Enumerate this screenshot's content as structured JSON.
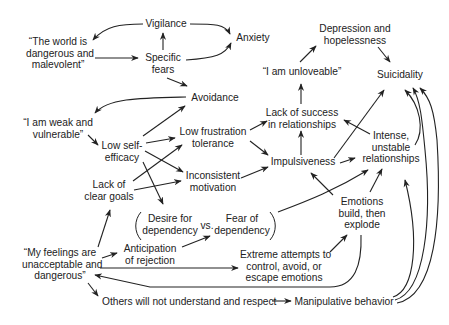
{
  "diagram": {
    "type": "causal-flow-diagram",
    "nodes": {
      "world": {
        "lines": [
          "“The world is",
          "dangerous and",
          "malevolent”"
        ]
      },
      "vigilance": {
        "lines": [
          "Vigilance"
        ]
      },
      "specific_fears": {
        "lines": [
          "Specific",
          "fears"
        ]
      },
      "anxiety": {
        "lines": [
          "Anxiety"
        ]
      },
      "depression": {
        "lines": [
          "Depression and",
          "hopelessness"
        ]
      },
      "unloveable": {
        "lines": [
          "“I am unloveable”"
        ]
      },
      "suicidality": {
        "lines": [
          "Suicidality"
        ]
      },
      "avoidance": {
        "lines": [
          "Avoidance"
        ]
      },
      "weak": {
        "lines": [
          "“I am weak and",
          "vulnerable”"
        ]
      },
      "low_self_efficacy": {
        "lines": [
          "Low self-",
          "efficacy"
        ]
      },
      "low_frustration": {
        "lines": [
          "Low frustration",
          "tolerance"
        ]
      },
      "lack_success": {
        "lines": [
          "Lack of success",
          "in relationships"
        ]
      },
      "intense": {
        "lines": [
          "Intense,",
          "unstable",
          "relationships"
        ]
      },
      "impulsiveness": {
        "lines": [
          "Impulsiveness"
        ]
      },
      "lack_goals": {
        "lines": [
          "Lack of",
          "clear goals"
        ]
      },
      "inconsistent": {
        "lines": [
          "Inconsistent",
          "motivation"
        ]
      },
      "desire_dep": {
        "lines": [
          "Desire for",
          "dependency"
        ]
      },
      "vs": {
        "lines": [
          "vs."
        ]
      },
      "fear_dep": {
        "lines": [
          "Fear of",
          "dependency"
        ]
      },
      "emotions": {
        "lines": [
          "Emotions",
          "build, then",
          "explode"
        ]
      },
      "feelings": {
        "lines": [
          "“My feelings are",
          "unacceptable and",
          "dangerous”"
        ]
      },
      "anticipation": {
        "lines": [
          "Anticipation",
          "of rejection"
        ]
      },
      "extreme": {
        "lines": [
          "Extreme attempts to",
          "control, avoid, or",
          "escape emotions"
        ]
      },
      "others": {
        "lines": [
          "Others will not understand and respect"
        ]
      },
      "manipulative": {
        "lines": [
          "Manipulative behavior"
        ]
      }
    },
    "edges": [
      {
        "from": "vigilance",
        "to": "world"
      },
      {
        "from": "world",
        "to": "specific_fears"
      },
      {
        "from": "specific_fears",
        "to": "vigilance"
      },
      {
        "from": "vigilance",
        "to": "anxiety"
      },
      {
        "from": "specific_fears",
        "to": "anxiety"
      },
      {
        "from": "specific_fears",
        "to": "avoidance"
      },
      {
        "from": "avoidance",
        "to": "weak"
      },
      {
        "from": "weak",
        "to": "low_self_efficacy"
      },
      {
        "from": "low_self_efficacy",
        "to": "avoidance"
      },
      {
        "from": "low_self_efficacy",
        "to": "low_frustration"
      },
      {
        "from": "low_self_efficacy",
        "to": "inconsistent"
      },
      {
        "from": "low_self_efficacy",
        "to": "desire_dep"
      },
      {
        "from": "lack_goals",
        "to": "low_frustration"
      },
      {
        "from": "lack_goals",
        "to": "inconsistent"
      },
      {
        "from": "low_frustration",
        "to": "lack_success"
      },
      {
        "from": "low_frustration",
        "to": "impulsiveness"
      },
      {
        "from": "inconsistent",
        "to": "impulsiveness"
      },
      {
        "from": "impulsiveness",
        "to": "lack_success"
      },
      {
        "from": "lack_success",
        "to": "unloveable"
      },
      {
        "from": "unloveable",
        "to": "depression"
      },
      {
        "from": "depression",
        "to": "suicidality"
      },
      {
        "from": "impulsiveness",
        "to": "suicidality"
      },
      {
        "from": "impulsiveness",
        "to": "intense"
      },
      {
        "from": "intense",
        "to": "lack_success"
      },
      {
        "from": "intense",
        "to": "suicidality"
      },
      {
        "from": "fear_dep",
        "to": "intense"
      },
      {
        "from": "emotions",
        "to": "impulsiveness"
      },
      {
        "from": "emotions",
        "to": "intense"
      },
      {
        "from": "feelings",
        "to": "lack_goals"
      },
      {
        "from": "feelings",
        "to": "anticipation"
      },
      {
        "from": "anticipation",
        "to": "fear_dep"
      },
      {
        "from": "feelings",
        "to": "extreme"
      },
      {
        "from": "extreme",
        "to": "emotions"
      },
      {
        "from": "emotions",
        "to": "feelings"
      },
      {
        "from": "feelings",
        "to": "others"
      },
      {
        "from": "others",
        "to": "manipulative"
      },
      {
        "from": "manipulative",
        "to": "intense"
      },
      {
        "from": "manipulative",
        "to": "suicidality"
      }
    ]
  }
}
